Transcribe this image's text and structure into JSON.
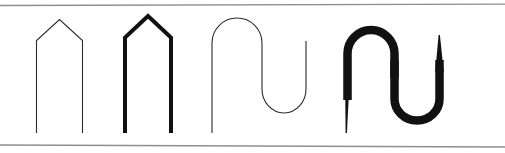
{
  "figure": {
    "background_color": "#ffffff",
    "width": 505,
    "height": 153,
    "rules": [
      {
        "name": "top-rule",
        "color": "#8c8f91",
        "thickness": 1.3,
        "x1": 0,
        "y1": 5.5,
        "x2": 505,
        "y2": 4.2
      },
      {
        "name": "bottom-rule",
        "color": "#8c8f91",
        "thickness": 1.3,
        "x1": 0,
        "y1": 145.0,
        "x2": 505,
        "y2": 147.0
      }
    ],
    "shapes": [
      {
        "name": "thin-peaked-arch",
        "label": "",
        "kind": "open-path",
        "stroke_color": "#2b2b2b",
        "stroke_width": 1.1,
        "path": "M 36.5 133 L 36.5 40.5 L 59.5 19.5 L 82.5 40.5 L 82.5 133"
      },
      {
        "name": "thick-peaked-arch",
        "label": "",
        "kind": "open-path",
        "stroke_color": "#111111",
        "stroke_width": 4.0,
        "path": "M 125 133 L 125 37.5 L 148 16.0 L 171 37.5 L 171 133"
      },
      {
        "name": "thin-serpentine-curve",
        "label": "",
        "kind": "open-path",
        "stroke_color": "#2b2b2b",
        "stroke_width": 1.1,
        "path": "M 212 133 L 212 43 A 25 25 0 0 1 262 43 L 262 89 A 22 24 0 0 0 306 89 L 306 41"
      },
      {
        "name": "thick-variable-serpentine-curve",
        "label": "",
        "kind": "filled-outline",
        "fill_color": "#111111",
        "stroke_width_min": 1.0,
        "stroke_width_max": 9.0,
        "outer_path": "M 345.0 132.8 L 347.6 132.8 L 348.6 63.0 C 348.6 47.0 356.0 36.5 370.5 33.2 C 385.5 29.8 398.6 38.0 401.3 50.0 L 406.6 92.0 C 410.0 112.6 400.0 124.8 382.0 124.6 C 366.0 124.5 357.0 113.0 361.0 100.5 C 365.0 88.0 379.0 86.5 381.0 95.5 L 381.0 95.5 C 379.5 90.0 370.0 91.5 368.5 100.5 C 367.0 110.5 373.5 118.0 383.5 118.0 C 396.0 118.0 403.2 109.0 400.5 92.0 L 395.0 50.0 C 393.0 41.0 384.5 35.5 373.0 38.0 C 362.0 40.5 355.8 49.5 355.8 63.0 L 355.0 132.8 Z",
        "tail_right_path": "M 399.5 92.0 C 402.5 110.0 395.0 119.5 383.5 119.5 L 383.5 119.5 C 396.0 119.5 404.0 110.5 401.0 92.0 Z",
        "description": "Thick S-curve with tapered thin tails at lower-left and upper-right"
      }
    ]
  }
}
